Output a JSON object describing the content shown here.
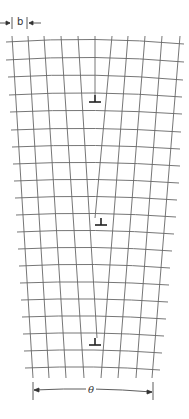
{
  "figure": {
    "labels": {
      "burgers_vector": "b",
      "tilt_angle": "θ"
    },
    "dislocation_symbol": "⊥",
    "dislocation_count": 3,
    "dislocation_positions_y": [
      95,
      218,
      338
    ],
    "line_color": "#555555",
    "symbol_color": "#222222"
  }
}
